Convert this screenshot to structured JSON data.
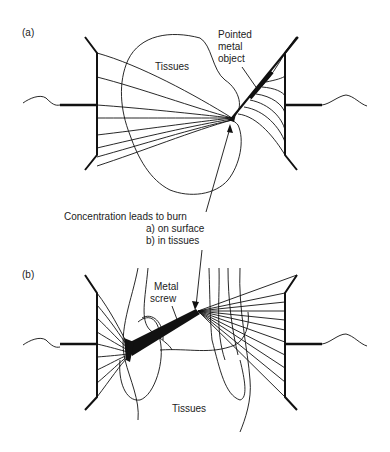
{
  "panels": {
    "a": {
      "label": "(a)",
      "tissue_label": "Tissues",
      "object_label_lines": [
        "Pointed",
        "metal",
        "object"
      ]
    },
    "b": {
      "label": "(b)",
      "tissue_label": "Tissues",
      "object_label_lines": [
        "Metal",
        "screw"
      ]
    }
  },
  "annotation": {
    "title": "Concentration leads to burn",
    "items": [
      "a)  on surface",
      "b)  in tissues"
    ]
  },
  "colors": {
    "ink": "#111111",
    "background": "#ffffff"
  }
}
